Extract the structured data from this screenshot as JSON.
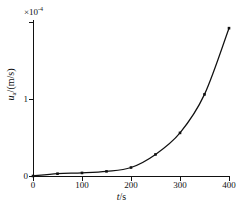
{
  "chart_data": {
    "type": "line",
    "title": "",
    "xlabel": "t/s",
    "ylabel": "u_a/(m/s)",
    "y_multiplier": "×10",
    "y_multiplier_exponent": "-4",
    "xlim": [
      0,
      400
    ],
    "ylim": [
      0,
      2.0
    ],
    "xticks": [
      0,
      100,
      200,
      300,
      400
    ],
    "xticklabels": [
      "0",
      "100",
      "200",
      "300",
      "400"
    ],
    "yticks": [
      0,
      1
    ],
    "yticklabels": [
      "0",
      "1"
    ],
    "grid": false,
    "legend": null,
    "marker": "square",
    "line_color": "#111111",
    "x": [
      0,
      50,
      100,
      150,
      200,
      250,
      300,
      350,
      400
    ],
    "values": [
      0.0,
      0.03,
      0.04,
      0.06,
      0.11,
      0.28,
      0.56,
      1.06,
      1.92
    ],
    "units": {
      "x": "s",
      "y": "m/s (×10⁻⁴)"
    },
    "annotations": []
  },
  "axis_titles": {
    "x_var": "t",
    "x_unit": "/s",
    "y_var": "u",
    "y_sub": "a",
    "y_unit": "/(m/s)"
  },
  "multiplier": {
    "times": "×",
    "base": "10",
    "exponent": "-4"
  }
}
